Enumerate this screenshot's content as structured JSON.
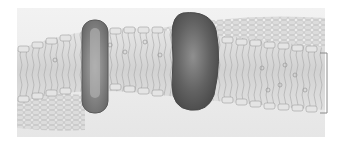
{
  "figure": {
    "kind": "membrane-diagram",
    "background_panel_color": "#efefef",
    "page_color": "#ffffff",
    "bilayer": {
      "head_color": "#d9d9d9",
      "head_stroke": "#9a9a9a",
      "tail_color": "#bdbdbd",
      "body_color": "#e2e2e2"
    },
    "proteins": [
      {
        "name": "small-transmembrane-protein",
        "color": "#8a8a8a"
      },
      {
        "name": "large-transmembrane-protein",
        "color": "#5e5e5e"
      }
    ],
    "bracket": {
      "label": "",
      "color": "#8a8a8a"
    }
  }
}
